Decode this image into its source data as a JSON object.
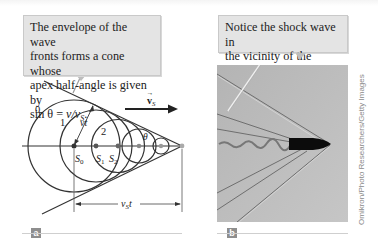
{
  "figure": {
    "panel_a": {
      "label": "a",
      "callout": {
        "line1": "The envelope of the wave",
        "line2": "fronts forms a cone whose",
        "line3": "apex half-angle is given by",
        "line4_prefix": "sin θ = ",
        "line4_formula": "v/v",
        "line4_sub": "S",
        "line4_suffix": "."
      },
      "diagram": {
        "wavefront_labels": [
          "0",
          "1",
          "2"
        ],
        "source_labels": [
          "S0",
          "S1",
          "S2"
        ],
        "radius_label": "vt",
        "angle_label": "θ",
        "velocity_label": "v",
        "velocity_sub": "S",
        "distance_label": "v",
        "distance_sub": "S",
        "distance_suffix": "t"
      }
    },
    "panel_b": {
      "label": "b",
      "callout": {
        "line1": "Notice the shock wave in",
        "line2": "the vicinity of the bullet."
      },
      "photo_alt": "bullet with shock wave",
      "credit": "Omikron/Photo Researchers/Getty Images"
    }
  }
}
